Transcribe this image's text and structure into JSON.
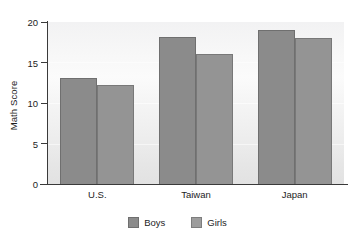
{
  "chart_data": {
    "type": "bar",
    "title": "",
    "xlabel": "",
    "ylabel": "Math Score",
    "categories": [
      "U.S.",
      "Taiwan",
      "Japan"
    ],
    "series": [
      {
        "name": "Boys",
        "color": "#8b8b8b",
        "values": [
          13.1,
          18.2,
          19.0
        ]
      },
      {
        "name": "Girls",
        "color": "#9d9d9d",
        "values": [
          12.2,
          16.0,
          18.0
        ]
      }
    ],
    "ylim": [
      0,
      20
    ],
    "yticks": [
      0,
      5,
      10,
      15,
      20
    ],
    "ytick_labels": [
      "0",
      "5",
      "10",
      "15",
      "20"
    ],
    "grid": false,
    "legend_position": "bottom",
    "panel_background": "#f3f3f3",
    "axis_color": "#3a3a3a"
  },
  "figure": {
    "title_remnant": ""
  }
}
